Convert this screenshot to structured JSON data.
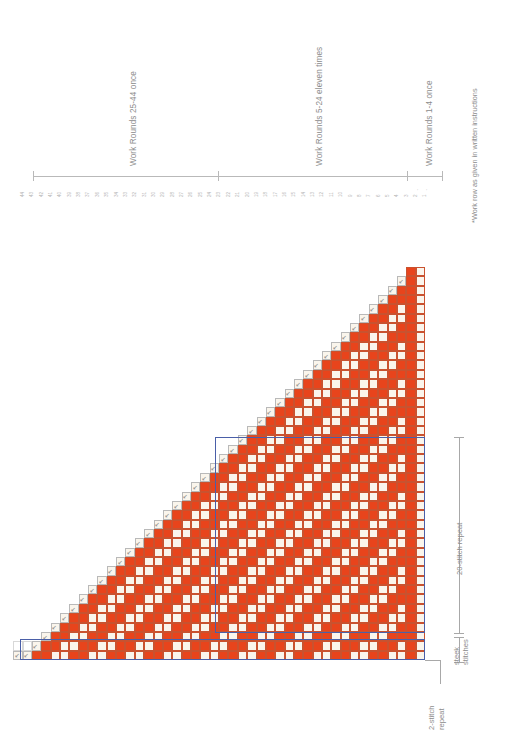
{
  "chart_meta": {
    "title": "Colorwork Knitting Chart",
    "orientation": "rotated-90",
    "colors": {
      "main_color": "#E8441C",
      "contrast_color": "#FAF5EC",
      "repeat_box": "#4A5FA8",
      "grid_line": "#c9522f",
      "annotation_text": "#8c8c8c",
      "bracket_line": "#b9b9b9"
    }
  },
  "annotations": {
    "rounds_brackets": [
      {
        "label": "Work Rounds 25-44 once"
      },
      {
        "label": "Work Rounds 5-24 eleven times"
      },
      {
        "label": "Work Rounds 1-4 once"
      }
    ],
    "footnote": "*Work row as given in written instructions",
    "stitch_repeat_label": "20-stitch repeat",
    "steek_label_line1": "steek",
    "steek_label_line2": "stitches",
    "two_stitch_repeat_line1": "2-stitch",
    "two_stitch_repeat_line2": "repeat"
  },
  "row_numbers": [
    "44",
    "43",
    "42",
    "41",
    "40",
    "39",
    "38",
    "37",
    "36",
    "35",
    "34",
    "33",
    "32",
    "31",
    "30",
    "29",
    "28",
    "27",
    "26",
    "25",
    "24",
    "23",
    "22",
    "21",
    "20",
    "19",
    "18",
    "17",
    "16",
    "15",
    "14",
    "13",
    "12",
    "11",
    "10",
    "9",
    "8",
    "7",
    "6",
    "5",
    "4",
    "3",
    "2",
    "1"
  ],
  "row_number_arrows": [
    "↓",
    "↓"
  ],
  "chart_data": {
    "type": "heatmap",
    "xlabel": "stitches",
    "ylabel": "rounds",
    "legend": [
      {
        "key": "mc",
        "color": "#E8441C",
        "name": "main color"
      },
      {
        "key": "cc",
        "color": "#FAF5EC",
        "name": "contrast color"
      },
      {
        "key": "dec",
        "color": "#FAF5EC",
        "name": "decrease"
      }
    ],
    "rounds": 44,
    "max_stitches": 42,
    "steek_stitches": 2,
    "stitch_repeat": 20
  }
}
